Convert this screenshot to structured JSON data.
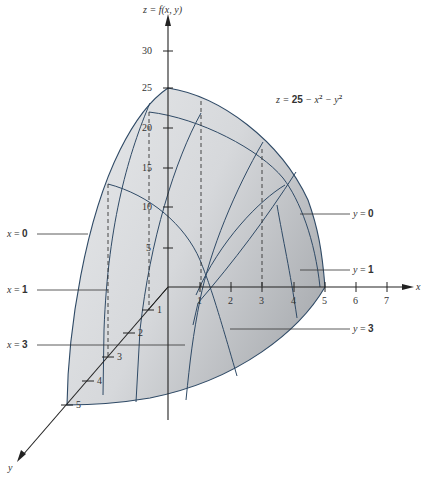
{
  "figure": {
    "equation": "z = 25 − x² − y²",
    "equation_parts": {
      "lhs": "z = ",
      "const": "25",
      "rest": " − x",
      "sq1": "2",
      "mid": " − y",
      "sq2": "2"
    },
    "z_axis_label": "z = f(x, y)",
    "x_axis_label": "x",
    "y_axis_label": "y",
    "z_ticks": [
      "5",
      "10",
      "15",
      "20",
      "25",
      "30"
    ],
    "x_ticks": [
      "1",
      "2",
      "3",
      "4",
      "5",
      "6",
      "7"
    ],
    "y_ticks": [
      "1",
      "2",
      "3",
      "4",
      "5"
    ],
    "left_labels": [
      {
        "var": "x",
        "val": "0"
      },
      {
        "var": "x",
        "val": "1"
      },
      {
        "var": "x",
        "val": "3"
      }
    ],
    "right_labels": [
      {
        "var": "y",
        "val": "0"
      },
      {
        "var": "y",
        "val": "1"
      },
      {
        "var": "y",
        "val": "3"
      }
    ],
    "colors": {
      "surface_light": "#e4e6e8",
      "surface_dark": "#b8bbbf",
      "curve": "#2f4a66",
      "axis": "#222222"
    }
  }
}
